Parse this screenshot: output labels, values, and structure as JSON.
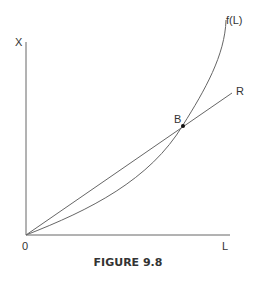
{
  "figure": {
    "caption": "FIGURE 9.8",
    "labels": {
      "y_axis": "X",
      "x_axis": "L",
      "origin": "0",
      "curve": "f(L)",
      "ray": "R",
      "point": "B"
    },
    "colors": {
      "line": "#555555",
      "text": "#333333"
    }
  }
}
